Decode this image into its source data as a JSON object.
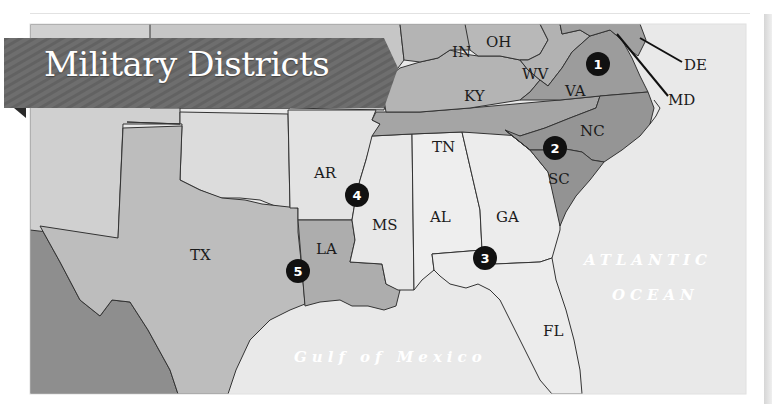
{
  "title": "Military Districts",
  "colors": {
    "background": "#ececec",
    "district_dark": "#8c8c8c",
    "district_mid": "#a9a9a9",
    "district_light": "#b9b9b9",
    "district_lighter": "#c9c9c9",
    "district_pale": "#e4e4e4",
    "other_state": "#d2d2d2",
    "mexico": "#8e8e8e",
    "banner": "#6b6b6b",
    "marker": "#111111"
  },
  "states": [
    {
      "abbr": "IN",
      "x": 452,
      "y": 52
    },
    {
      "abbr": "OH",
      "x": 504,
      "y": 42
    },
    {
      "abbr": "WV",
      "x": 536,
      "y": 76
    },
    {
      "abbr": "VA",
      "x": 588,
      "y": 92
    },
    {
      "abbr": "KY",
      "x": 480,
      "y": 100
    },
    {
      "abbr": "DE",
      "x": 708,
      "y": 70
    },
    {
      "abbr": "MD",
      "x": 692,
      "y": 104
    },
    {
      "abbr": "TN",
      "x": 446,
      "y": 150
    },
    {
      "abbr": "NC",
      "x": 604,
      "y": 134
    },
    {
      "abbr": "SC",
      "x": 556,
      "y": 182
    },
    {
      "abbr": "AR",
      "x": 328,
      "y": 180
    },
    {
      "abbr": "MS",
      "x": 386,
      "y": 230
    },
    {
      "abbr": "AL",
      "x": 444,
      "y": 222
    },
    {
      "abbr": "GA",
      "x": 512,
      "y": 222
    },
    {
      "abbr": "LA",
      "x": 326,
      "y": 250
    },
    {
      "abbr": "TX",
      "x": 206,
      "y": 258
    },
    {
      "abbr": "FL",
      "x": 548,
      "y": 320
    }
  ],
  "districts": [
    {
      "number": "1",
      "x": 598,
      "y": 64,
      "states": [
        "VA"
      ]
    },
    {
      "number": "2",
      "x": 554,
      "y": 148,
      "states": [
        "NC",
        "SC"
      ]
    },
    {
      "number": "3",
      "x": 485,
      "y": 258,
      "states": [
        "GA",
        "AL",
        "FL"
      ]
    },
    {
      "number": "4",
      "x": 357,
      "y": 194,
      "states": [
        "MS",
        "AR"
      ]
    },
    {
      "number": "5",
      "x": 298,
      "y": 270,
      "states": [
        "LA",
        "TX"
      ]
    }
  ],
  "water_labels": [
    {
      "name": "atlantic_line1",
      "text": "ATLANTIC",
      "x": 590,
      "y": 262
    },
    {
      "name": "atlantic_line2",
      "text": "OCEAN",
      "x": 614,
      "y": 298
    },
    {
      "name": "gulf",
      "text": "Gulf of Mexico",
      "x": 294,
      "y": 360
    }
  ],
  "labels_text": {
    "IN": "IN",
    "OH": "OH",
    "WV": "WV",
    "VA": "VA",
    "KY": "KY",
    "DE": "DE",
    "MD": "MD",
    "TN": "TN",
    "NC": "NC",
    "SC": "SC",
    "AR": "AR",
    "MS": "MS",
    "AL": "AL",
    "GA": "GA",
    "LA": "LA",
    "TX": "TX",
    "FL": "FL"
  }
}
